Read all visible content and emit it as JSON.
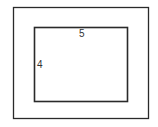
{
  "diagram": {
    "type": "nested-rectangles",
    "outer_rect": {
      "x": 13,
      "y": 7,
      "width": 136,
      "height": 112
    },
    "inner_rect": {
      "x": 34,
      "y": 27,
      "width": 94,
      "height": 75
    },
    "labels": {
      "width": "5",
      "height": "4"
    },
    "stroke_color": "#2a2a2a"
  }
}
